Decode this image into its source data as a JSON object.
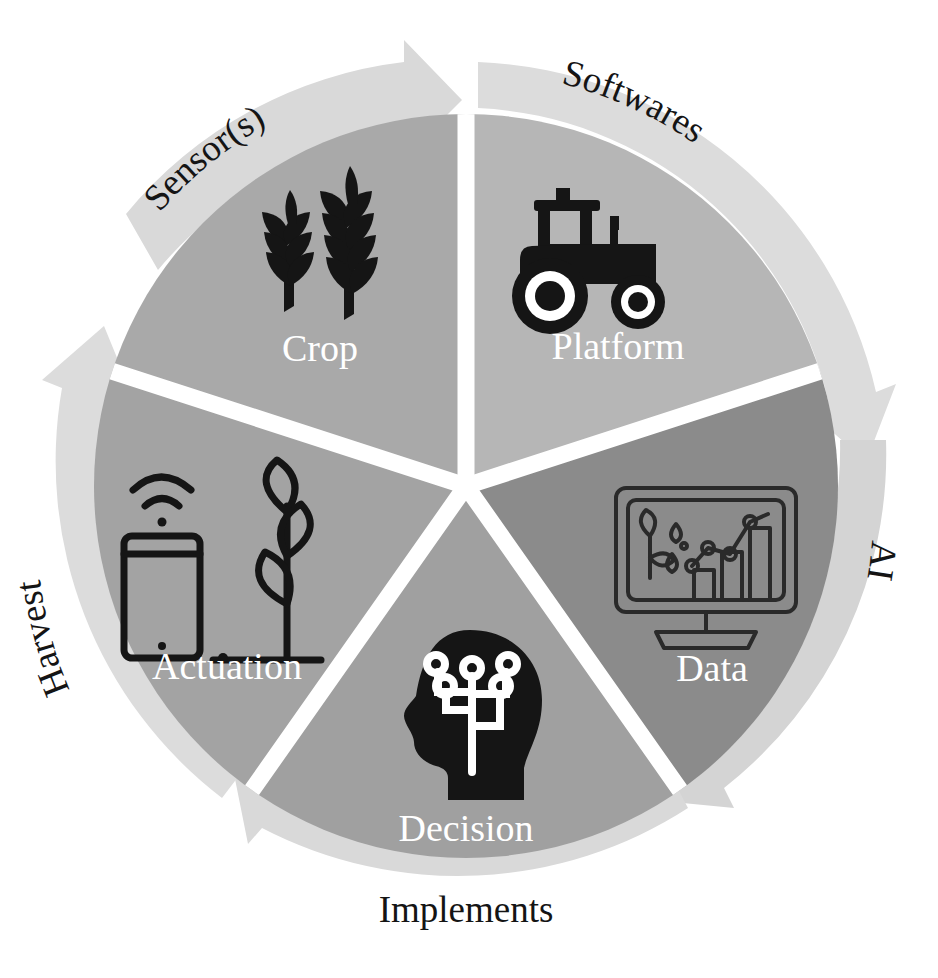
{
  "diagram": {
    "type": "cyclic-wheel",
    "center": {
      "x": 466,
      "y": 486
    },
    "inner_radius": 372,
    "outer_ring": {
      "inner_radius": 378,
      "outer_radius": 424,
      "color": "#d9d9d9",
      "direction": "clockwise",
      "arrow_count": 5
    },
    "segments": [
      {
        "id": "crop",
        "label": "Crop",
        "ring_label": "Sensor(s)",
        "icon": "wheat-icon",
        "color": "#a9a9a9",
        "start_angle": -90,
        "end_angle": -18,
        "label_x": 320,
        "label_y": 350,
        "icon_x": 318,
        "icon_y": 255
      },
      {
        "id": "platform",
        "label": "Platform",
        "ring_label": "Softwares",
        "icon": "tractor-icon",
        "color": "#b6b6b6",
        "start_angle": -18,
        "end_angle": 54,
        "label_x": 618,
        "label_y": 350,
        "icon_x": 612,
        "icon_y": 252
      },
      {
        "id": "data",
        "label": "Data",
        "ring_label": "AI",
        "icon": "analytics-monitor-icon",
        "color": "#8b8b8b",
        "start_angle": 54,
        "end_angle": 126,
        "label_x": 712,
        "label_y": 672,
        "icon_x": 706,
        "icon_y": 562
      },
      {
        "id": "decision",
        "label": "Decision",
        "ring_label": "Implements",
        "icon": "circuit-head-icon",
        "color": "#a0a0a0",
        "start_angle": 126,
        "end_angle": 198,
        "label_x": 466,
        "label_y": 832,
        "icon_x": 466,
        "icon_y": 722
      },
      {
        "id": "actuation",
        "label": "Actuation",
        "ring_label": "Harvest",
        "icon": "phone-wifi-plant-icon",
        "color": "#a3a3a3",
        "start_angle": 198,
        "end_angle": 270,
        "label_x": 227,
        "label_y": 670,
        "icon_x": 225,
        "icon_y": 562
      }
    ],
    "ring_labels": {
      "sensors": "Sensor(s)",
      "softwares": "Softwares",
      "ai": "AI",
      "implements": "Implements",
      "harvest": "Harvest"
    },
    "colors": {
      "background": "#ffffff",
      "ring": "#d9d9d9",
      "gap": "#ffffff",
      "label_text": "#ffffff",
      "ring_text": "#141414",
      "icon": "#151515"
    }
  }
}
